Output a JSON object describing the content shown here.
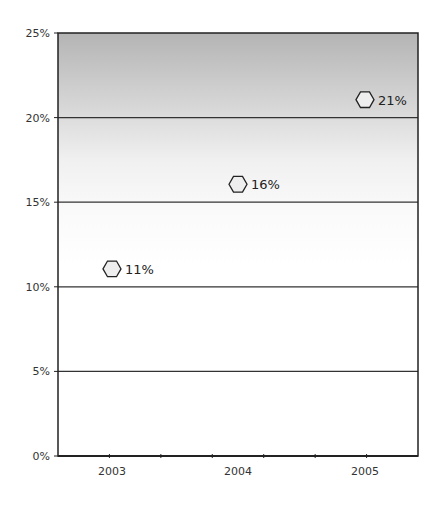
{
  "chart_data": {
    "type": "scatter",
    "title": "",
    "xlabel": "",
    "ylabel": "",
    "categories": [
      "2003",
      "2004",
      "2005"
    ],
    "series": [
      {
        "name": "Series 1",
        "values": [
          11,
          16,
          21
        ],
        "labels": [
          "11%",
          "16%",
          "21%"
        ],
        "marker": "hexagon"
      }
    ],
    "ylim": [
      0,
      25
    ],
    "yticks": [
      0,
      5,
      10,
      15,
      20,
      25
    ],
    "ytick_labels": [
      "0%",
      "5%",
      "10%",
      "15%",
      "20%",
      "25%"
    ],
    "grid": true,
    "legend": "none",
    "background": "vertical gradient gray (top) to white"
  },
  "colors": {
    "gradient_top": "#b4b4b4",
    "gradient_bottom": "#ffffff",
    "gridline": "#333333",
    "axis": "#222222",
    "marker_stroke": "#222222",
    "marker_fill": "#eeeeee"
  }
}
